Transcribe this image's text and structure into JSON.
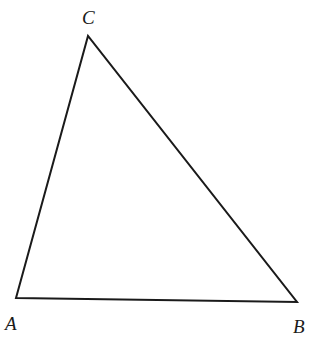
{
  "diagram": {
    "type": "triangle",
    "stroke_color": "#1a1a1a",
    "vertices": [
      {
        "name": "A",
        "x": 16,
        "y": 298,
        "label_x": 5,
        "label_y": 330
      },
      {
        "name": "B",
        "x": 297,
        "y": 302,
        "label_x": 293,
        "label_y": 333
      },
      {
        "name": "C",
        "x": 88,
        "y": 36,
        "label_x": 82,
        "label_y": 24
      }
    ],
    "labels": {
      "a": "A",
      "b": "B",
      "c": "C"
    }
  }
}
